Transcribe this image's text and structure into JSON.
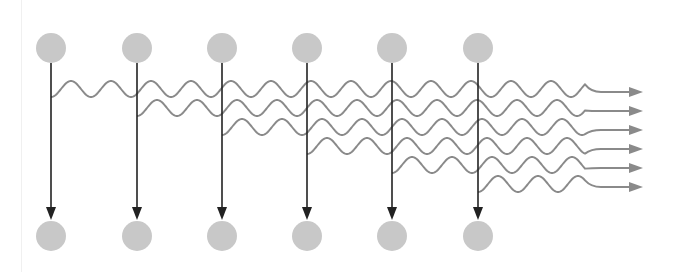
{
  "diagram": {
    "type": "stimulated-emission-cascade",
    "colors": {
      "atom_fill": "#c8c8c8",
      "transition_arrow": "#222222",
      "photon_wave": "#8a8a8a",
      "background": "#ffffff"
    },
    "atoms": {
      "count": 6,
      "x_positions": [
        51,
        137,
        222,
        307,
        392,
        478
      ],
      "upper_level_y": 48,
      "lower_level_y": 236,
      "radius": 15
    },
    "photons": {
      "count": 6,
      "row_y": [
        89,
        108,
        127,
        146,
        165,
        184
      ],
      "wavelength": 40,
      "amplitude": 8,
      "output_arrow_x_end": 643,
      "wave_end_x": 585
    },
    "labels": []
  }
}
